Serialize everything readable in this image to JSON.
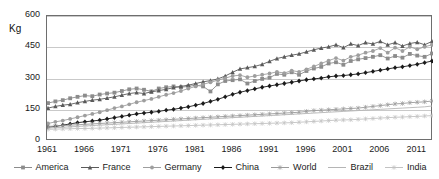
{
  "chart_data": {
    "type": "line",
    "title": "",
    "xlabel": "",
    "ylabel": "Kg",
    "unit_label": "Kg",
    "ylim": [
      0,
      600
    ],
    "xlim": [
      1961,
      2013
    ],
    "yticks": [
      0,
      150,
      300,
      450,
      600
    ],
    "ytick_labels": [
      "0",
      "150",
      "300",
      "450",
      "600"
    ],
    "xtick_labels": [
      "1961",
      "1966",
      "1971",
      "1976",
      "1981",
      "1986",
      "1991",
      "1996",
      "2001",
      "2006",
      "2011"
    ],
    "xticks": [
      1961,
      1966,
      1971,
      1976,
      1981,
      1986,
      1991,
      1996,
      2001,
      2006,
      2011
    ],
    "grid": true,
    "grid_axis": "y",
    "legend_position": "bottom",
    "x": [
      1961,
      1962,
      1963,
      1964,
      1965,
      1966,
      1967,
      1968,
      1969,
      1970,
      1971,
      1972,
      1973,
      1974,
      1975,
      1976,
      1977,
      1978,
      1979,
      1980,
      1981,
      1982,
      1983,
      1984,
      1985,
      1986,
      1987,
      1988,
      1989,
      1990,
      1991,
      1992,
      1993,
      1994,
      1995,
      1996,
      1997,
      1998,
      1999,
      2000,
      2001,
      2002,
      2003,
      2004,
      2005,
      2006,
      2007,
      2008,
      2009,
      2010,
      2011,
      2012,
      2013
    ],
    "series": [
      {
        "name": "America",
        "color": "#8c8c8c",
        "marker": "square",
        "values": [
          182,
          190,
          196,
          205,
          212,
          218,
          215,
          223,
          228,
          232,
          240,
          248,
          252,
          246,
          238,
          252,
          258,
          262,
          258,
          262,
          268,
          262,
          238,
          272,
          288,
          292,
          296,
          276,
          288,
          298,
          304,
          322,
          318,
          330,
          318,
          336,
          348,
          356,
          372,
          378,
          366,
          384,
          392,
          398,
          404,
          412,
          396,
          408,
          400,
          418,
          410,
          404,
          420
        ]
      },
      {
        "name": "France",
        "color": "#5a5a5a",
        "marker": "triangle",
        "values": [
          158,
          166,
          172,
          176,
          184,
          190,
          196,
          200,
          206,
          212,
          220,
          228,
          232,
          228,
          236,
          242,
          248,
          256,
          262,
          268,
          276,
          284,
          290,
          298,
          312,
          330,
          346,
          352,
          358,
          368,
          382,
          396,
          404,
          412,
          418,
          428,
          438,
          446,
          452,
          462,
          448,
          466,
          458,
          472,
          466,
          478,
          462,
          472,
          456,
          468,
          474,
          462,
          478
        ]
      },
      {
        "name": "Germany",
        "color": "#9e9e9e",
        "marker": "circle",
        "values": [
          84,
          92,
          98,
          106,
          114,
          122,
          130,
          138,
          148,
          158,
          166,
          176,
          186,
          194,
          202,
          212,
          222,
          230,
          240,
          252,
          262,
          272,
          282,
          292,
          302,
          312,
          316,
          306,
          312,
          318,
          324,
          332,
          326,
          338,
          332,
          344,
          358,
          372,
          386,
          398,
          386,
          404,
          412,
          424,
          432,
          446,
          424,
          448,
          432,
          452,
          440,
          452,
          462
        ]
      },
      {
        "name": "China",
        "color": "#1a1a1a",
        "marker": "diamond",
        "values": [
          66,
          70,
          76,
          82,
          88,
          92,
          96,
          100,
          106,
          112,
          118,
          124,
          130,
          134,
          138,
          142,
          148,
          152,
          158,
          164,
          172,
          180,
          190,
          200,
          212,
          224,
          234,
          242,
          250,
          258,
          264,
          270,
          276,
          282,
          288,
          294,
          298,
          302,
          308,
          312,
          314,
          318,
          322,
          328,
          334,
          340,
          346,
          352,
          356,
          362,
          368,
          376,
          384
        ]
      },
      {
        "name": "World",
        "color": "#9a9a9a",
        "marker": "star",
        "values": [
          70,
          72,
          74,
          76,
          78,
          80,
          82,
          84,
          86,
          88,
          90,
          92,
          94,
          96,
          98,
          100,
          102,
          104,
          106,
          108,
          110,
          112,
          114,
          116,
          118,
          120,
          122,
          124,
          126,
          128,
          130,
          132,
          134,
          136,
          138,
          142,
          146,
          148,
          150,
          152,
          154,
          156,
          158,
          162,
          166,
          170,
          174,
          178,
          180,
          184,
          186,
          188,
          192
        ]
      },
      {
        "name": "Brazil",
        "color": "#b5b5b5",
        "marker": "none",
        "values": [
          62,
          64,
          66,
          68,
          70,
          72,
          74,
          76,
          78,
          80,
          82,
          84,
          86,
          88,
          90,
          92,
          94,
          96,
          98,
          100,
          102,
          104,
          106,
          108,
          110,
          112,
          114,
          116,
          118,
          120,
          122,
          124,
          126,
          128,
          130,
          132,
          134,
          136,
          138,
          140,
          142,
          144,
          146,
          148,
          150,
          152,
          154,
          156,
          158,
          160,
          162,
          164,
          168
        ]
      },
      {
        "name": "India",
        "color": "#c2c2c2",
        "marker": "cross",
        "values": [
          56,
          57,
          58,
          59,
          60,
          60,
          61,
          62,
          63,
          64,
          65,
          66,
          67,
          68,
          69,
          70,
          71,
          72,
          73,
          74,
          75,
          76,
          77,
          78,
          79,
          80,
          81,
          82,
          83,
          84,
          85,
          86,
          87,
          88,
          90,
          92,
          94,
          96,
          98,
          100,
          101,
          102,
          104,
          106,
          108,
          110,
          112,
          114,
          115,
          117,
          118,
          120,
          122
        ]
      }
    ]
  }
}
